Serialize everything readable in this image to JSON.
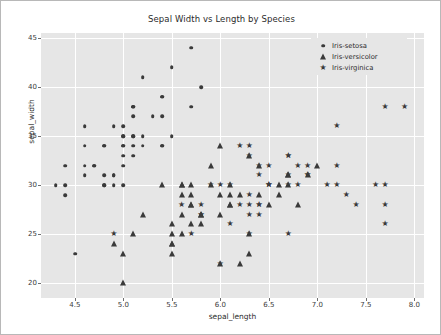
{
  "chart_data": {
    "type": "scatter",
    "title": "Sepal Width vs Length by Species",
    "xlabel": "sepal_length",
    "ylabel": "sepal_width",
    "xlim": [
      4.15,
      8.1
    ],
    "ylim": [
      1.85,
      4.55
    ],
    "xticks": [
      "4.5",
      "5.0",
      "5.5",
      "6.0",
      "6.5",
      "7.0",
      "7.5",
      "8.0"
    ],
    "xtick_values": [
      4.5,
      5.0,
      5.5,
      6.0,
      6.5,
      7.0,
      7.5,
      8.0
    ],
    "yticks": [
      "20",
      "25",
      "30",
      "35",
      "40",
      "45"
    ],
    "ytick_values": [
      2.0,
      2.5,
      3.0,
      3.5,
      4.0,
      4.5
    ],
    "grid": true,
    "legend_position": "upper right",
    "plot_bgcolor": "#e6e6e6",
    "grid_color": "#ffffff",
    "marker_color": "#3a3a3a",
    "series": [
      {
        "name": "Iris-setosa",
        "marker": "circle",
        "marker_icon": "dot-marker-icon",
        "points": [
          [
            5.1,
            3.5
          ],
          [
            4.9,
            3.0
          ],
          [
            4.7,
            3.2
          ],
          [
            4.6,
            3.1
          ],
          [
            5.0,
            3.6
          ],
          [
            5.4,
            3.9
          ],
          [
            4.6,
            3.4
          ],
          [
            5.0,
            3.4
          ],
          [
            4.4,
            2.9
          ],
          [
            4.9,
            3.1
          ],
          [
            5.4,
            3.7
          ],
          [
            4.8,
            3.4
          ],
          [
            4.8,
            3.0
          ],
          [
            4.3,
            3.0
          ],
          [
            5.8,
            4.0
          ],
          [
            5.7,
            4.4
          ],
          [
            5.4,
            3.9
          ],
          [
            5.1,
            3.5
          ],
          [
            5.7,
            3.8
          ],
          [
            5.1,
            3.8
          ],
          [
            5.4,
            3.4
          ],
          [
            5.1,
            3.7
          ],
          [
            4.6,
            3.6
          ],
          [
            5.1,
            3.3
          ],
          [
            4.8,
            3.4
          ],
          [
            5.0,
            3.0
          ],
          [
            5.0,
            3.4
          ],
          [
            5.2,
            3.5
          ],
          [
            5.2,
            3.4
          ],
          [
            4.7,
            3.2
          ],
          [
            4.8,
            3.1
          ],
          [
            5.4,
            3.4
          ],
          [
            5.2,
            4.1
          ],
          [
            5.5,
            4.2
          ],
          [
            4.9,
            3.1
          ],
          [
            5.0,
            3.2
          ],
          [
            5.5,
            3.5
          ],
          [
            4.9,
            3.6
          ],
          [
            4.4,
            3.0
          ],
          [
            5.1,
            3.4
          ],
          [
            5.0,
            3.5
          ],
          [
            4.5,
            2.3
          ],
          [
            4.4,
            3.2
          ],
          [
            5.0,
            3.5
          ],
          [
            5.1,
            3.8
          ],
          [
            4.8,
            3.0
          ],
          [
            5.1,
            3.8
          ],
          [
            4.6,
            3.2
          ],
          [
            5.3,
            3.7
          ],
          [
            5.0,
            3.3
          ]
        ]
      },
      {
        "name": "Iris-versicolor",
        "marker": "triangle",
        "marker_icon": "triangle-marker-icon",
        "points": [
          [
            7.0,
            3.2
          ],
          [
            6.4,
            3.2
          ],
          [
            6.9,
            3.1
          ],
          [
            5.5,
            2.3
          ],
          [
            6.5,
            2.8
          ],
          [
            5.7,
            2.8
          ],
          [
            6.3,
            3.3
          ],
          [
            4.9,
            2.4
          ],
          [
            6.6,
            2.9
          ],
          [
            5.2,
            2.7
          ],
          [
            5.0,
            2.0
          ],
          [
            5.9,
            3.0
          ],
          [
            6.0,
            2.2
          ],
          [
            6.1,
            2.9
          ],
          [
            5.6,
            2.9
          ],
          [
            6.7,
            3.1
          ],
          [
            5.6,
            3.0
          ],
          [
            5.8,
            2.7
          ],
          [
            6.2,
            2.2
          ],
          [
            5.6,
            2.5
          ],
          [
            5.9,
            3.2
          ],
          [
            6.1,
            2.8
          ],
          [
            6.3,
            2.5
          ],
          [
            6.1,
            2.8
          ],
          [
            6.4,
            2.9
          ],
          [
            6.6,
            3.0
          ],
          [
            6.8,
            2.8
          ],
          [
            6.7,
            3.0
          ],
          [
            6.0,
            2.9
          ],
          [
            5.7,
            2.6
          ],
          [
            5.5,
            2.4
          ],
          [
            5.5,
            2.4
          ],
          [
            5.8,
            2.7
          ],
          [
            6.0,
            2.7
          ],
          [
            5.4,
            3.0
          ],
          [
            6.0,
            3.4
          ],
          [
            6.7,
            3.1
          ],
          [
            6.3,
            2.3
          ],
          [
            5.6,
            3.0
          ],
          [
            5.5,
            2.5
          ],
          [
            5.5,
            2.6
          ],
          [
            6.1,
            3.0
          ],
          [
            5.8,
            2.6
          ],
          [
            5.0,
            2.3
          ],
          [
            5.6,
            2.7
          ],
          [
            5.7,
            3.0
          ],
          [
            5.7,
            2.9
          ],
          [
            6.2,
            2.9
          ],
          [
            5.1,
            2.5
          ],
          [
            5.7,
            2.8
          ]
        ]
      },
      {
        "name": "Iris-virginica",
        "marker": "star",
        "marker_icon": "star-marker-icon",
        "points": [
          [
            6.3,
            3.3
          ],
          [
            5.8,
            2.7
          ],
          [
            7.1,
            3.0
          ],
          [
            6.3,
            2.9
          ],
          [
            6.5,
            3.0
          ],
          [
            7.6,
            3.0
          ],
          [
            4.9,
            2.5
          ],
          [
            7.3,
            2.9
          ],
          [
            6.7,
            2.5
          ],
          [
            7.2,
            3.6
          ],
          [
            6.5,
            3.2
          ],
          [
            6.4,
            2.7
          ],
          [
            6.8,
            3.0
          ],
          [
            5.7,
            2.5
          ],
          [
            5.8,
            2.8
          ],
          [
            6.4,
            3.2
          ],
          [
            6.5,
            3.0
          ],
          [
            7.7,
            3.8
          ],
          [
            7.7,
            2.6
          ],
          [
            6.0,
            2.2
          ],
          [
            6.9,
            3.2
          ],
          [
            5.6,
            2.8
          ],
          [
            7.7,
            2.8
          ],
          [
            6.3,
            2.7
          ],
          [
            6.7,
            3.3
          ],
          [
            7.2,
            3.2
          ],
          [
            6.2,
            2.8
          ],
          [
            6.1,
            3.0
          ],
          [
            6.4,
            2.8
          ],
          [
            7.2,
            3.0
          ],
          [
            7.4,
            2.8
          ],
          [
            7.9,
            3.8
          ],
          [
            6.4,
            2.8
          ],
          [
            6.3,
            2.8
          ],
          [
            6.1,
            2.6
          ],
          [
            7.7,
            3.0
          ],
          [
            6.3,
            3.4
          ],
          [
            6.4,
            3.1
          ],
          [
            6.0,
            3.0
          ],
          [
            6.9,
            3.1
          ],
          [
            6.7,
            3.1
          ],
          [
            6.9,
            3.1
          ],
          [
            5.8,
            2.7
          ],
          [
            6.8,
            3.2
          ],
          [
            6.7,
            3.3
          ],
          [
            6.7,
            3.0
          ],
          [
            6.3,
            2.5
          ],
          [
            6.5,
            3.0
          ],
          [
            6.2,
            3.4
          ],
          [
            5.9,
            3.0
          ]
        ]
      }
    ]
  }
}
